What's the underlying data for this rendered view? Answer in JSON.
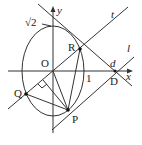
{
  "diagram": {
    "axes": {
      "x_label": "x",
      "y_label": "y",
      "origin_label": "O"
    },
    "ticks": {
      "x_one": "1",
      "y_sqrt2": "√2"
    },
    "points": {
      "R": "R",
      "P": "P",
      "Q": "Q",
      "D": "D"
    },
    "lines": {
      "t": "t",
      "l": "l",
      "d": "d"
    },
    "colors": {
      "stroke": "#333333",
      "background": "#ffffff"
    }
  }
}
